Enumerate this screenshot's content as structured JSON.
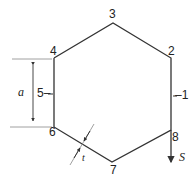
{
  "diagram": {
    "type": "hexagonal thin-walled cross-section",
    "colors": {
      "stroke": "#333333",
      "thin": "#888888",
      "text": "#222222"
    },
    "vertices": [
      {
        "id": "3",
        "label": "3",
        "x": 113,
        "y": 23
      },
      {
        "id": "2",
        "label": "2",
        "x": 171,
        "y": 58
      },
      {
        "id": "8",
        "label": "8",
        "x": 171,
        "y": 130
      },
      {
        "id": "7",
        "label": "7",
        "x": 112,
        "y": 162
      },
      {
        "id": "6",
        "label": "6",
        "x": 54,
        "y": 127
      },
      {
        "id": "4",
        "label": "4",
        "x": 54,
        "y": 58
      }
    ],
    "midpoint_labels": [
      {
        "id": "1",
        "label": "–1"
      },
      {
        "id": "5",
        "label": "5–"
      }
    ],
    "dimension": {
      "label": "a",
      "description": "side length"
    },
    "thickness": {
      "label": "t"
    },
    "force": {
      "label": "S",
      "direction": "down"
    }
  }
}
